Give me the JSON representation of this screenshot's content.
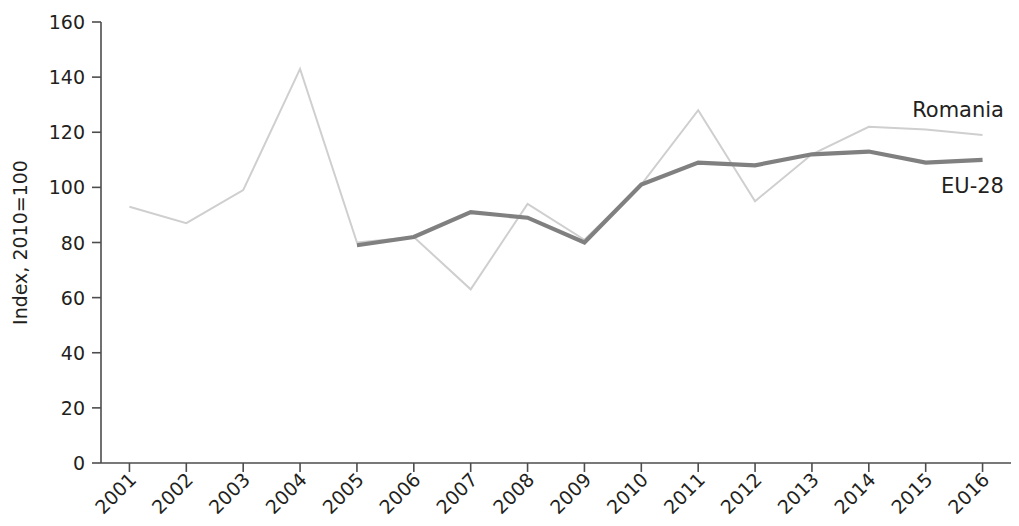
{
  "chart_data": {
    "type": "line",
    "title": "",
    "subtitle": "",
    "xlabel": "",
    "ylabel": "Index, 2010=100",
    "ylim": [
      0,
      160
    ],
    "ytick_step": 20,
    "yticks": [
      "0",
      "20",
      "40",
      "60",
      "80",
      "100",
      "120",
      "140",
      "160"
    ],
    "grid": false,
    "legend_position": "right-inline-labels",
    "categories": [
      "2001",
      "2002",
      "2003",
      "2004",
      "2005",
      "2006",
      "2007",
      "2008",
      "2009",
      "2010",
      "2011",
      "2012",
      "2013",
      "2014",
      "2015",
      "2016"
    ],
    "series": [
      {
        "name": "Romania",
        "color": "#cfcfcf",
        "values": [
          93,
          87,
          99,
          143,
          80,
          82,
          63,
          94,
          81,
          101,
          128,
          95,
          112,
          122,
          121,
          119
        ]
      },
      {
        "name": "EU-28",
        "color": "#808080",
        "values": [
          null,
          null,
          null,
          null,
          79,
          82,
          91,
          89,
          80,
          101,
          109,
          108,
          112,
          113,
          109,
          110
        ]
      }
    ]
  },
  "labels": {
    "romania": "Romania",
    "eu28": "EU-28",
    "y_axis_title": "Index, 2010=100"
  }
}
